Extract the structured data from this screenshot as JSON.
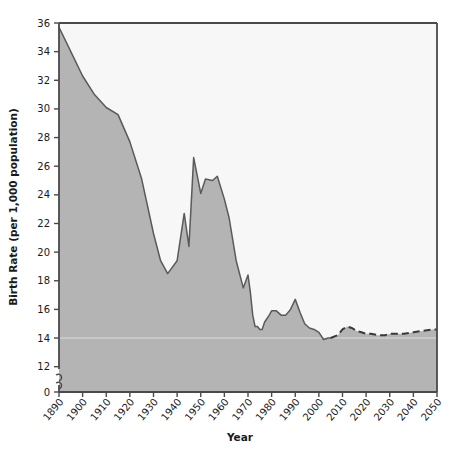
{
  "chart_data": {
    "type": "area",
    "title": "",
    "xlabel": "Year",
    "ylabel": "Birth Rate (per 1,000 population)",
    "xlim": [
      1890,
      2050
    ],
    "ylim": [
      11,
      36
    ],
    "ybaseline_label": "0",
    "axis_break": true,
    "grid": false,
    "legend": null,
    "ytick_labels": [
      "36",
      "34",
      "32",
      "30",
      "28",
      "26",
      "24",
      "22",
      "20",
      "18",
      "16",
      "14",
      "12",
      "0"
    ],
    "ytick_values": [
      36,
      34,
      32,
      30,
      28,
      26,
      24,
      22,
      20,
      18,
      16,
      14,
      12
    ],
    "xtick_labels": [
      "1890",
      "1900",
      "1910",
      "1920",
      "1930",
      "1940",
      "1950",
      "1960",
      "1970",
      "1980",
      "1990",
      "2000",
      "2010",
      "2020",
      "2030",
      "2040",
      "2050"
    ],
    "xtick_values": [
      1890,
      1900,
      1910,
      1920,
      1930,
      1940,
      1950,
      1960,
      1970,
      1980,
      1990,
      2000,
      2010,
      2020,
      2030,
      2040,
      2050
    ],
    "series": [
      {
        "name": "Observed birth rate",
        "line_style": "solid",
        "x": [
          1890,
          1895,
          1900,
          1905,
          1910,
          1915,
          1920,
          1925,
          1930,
          1933,
          1936,
          1940,
          1943,
          1945,
          1947,
          1950,
          1952,
          1955,
          1957,
          1960,
          1962,
          1965,
          1968,
          1970,
          1971,
          1972,
          1973,
          1974,
          1975,
          1976,
          1977,
          1979,
          1980,
          1982,
          1984,
          1986,
          1988,
          1990,
          1992,
          1994,
          1996,
          1998,
          2000,
          2002,
          2004,
          2005
        ],
        "y": [
          35.7,
          34.0,
          32.3,
          31.0,
          30.1,
          29.6,
          27.7,
          25.1,
          21.3,
          19.4,
          18.5,
          19.4,
          22.7,
          20.4,
          26.6,
          24.1,
          25.1,
          25.0,
          25.3,
          23.7,
          22.4,
          19.4,
          17.5,
          18.4,
          17.2,
          15.6,
          14.8,
          14.8,
          14.6,
          14.6,
          15.1,
          15.6,
          15.9,
          15.9,
          15.6,
          15.6,
          16.0,
          16.7,
          15.8,
          15.0,
          14.7,
          14.6,
          14.4,
          13.9,
          14.0,
          14.0
        ]
      },
      {
        "name": "Projected birth rate",
        "line_style": "dashed",
        "x": [
          2005,
          2008,
          2010,
          2012,
          2014,
          2016,
          2018,
          2020,
          2022,
          2025,
          2028,
          2030,
          2033,
          2036,
          2040,
          2044,
          2048,
          2050
        ],
        "y": [
          14.0,
          14.2,
          14.6,
          14.8,
          14.7,
          14.5,
          14.4,
          14.3,
          14.3,
          14.2,
          14.2,
          14.3,
          14.3,
          14.3,
          14.4,
          14.5,
          14.6,
          14.6
        ]
      }
    ]
  },
  "colors": {
    "area_fill": "#b4b4b4",
    "plot_background": "#f7f7f7",
    "line": "#5a5a5a",
    "axis": "#4a4a4a",
    "text": "#1a1a1a"
  }
}
